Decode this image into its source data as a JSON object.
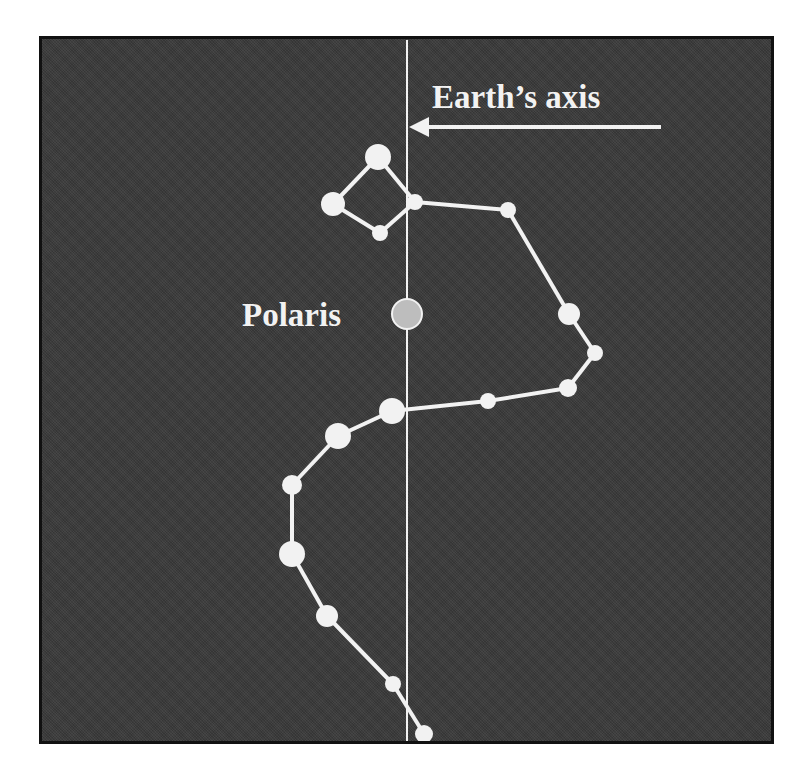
{
  "labels": {
    "axis": "Earth’s axis",
    "polaris": "Polaris"
  },
  "colors": {
    "background": "#3b3b3b",
    "border": "#111111",
    "stars": "#f2f2f2",
    "polaris_fill": "#bdbdbd"
  },
  "axis_line": {
    "x": 407,
    "y1": 40,
    "y2": 742
  },
  "arrow": {
    "x1": 661,
    "x2": 409,
    "y": 127
  },
  "polaris": {
    "x": 407,
    "y": 314,
    "r": 15
  },
  "stars": [
    {
      "x": 378,
      "y": 157,
      "r": 13
    },
    {
      "x": 333,
      "y": 204,
      "r": 12
    },
    {
      "x": 380,
      "y": 233,
      "r": 8
    },
    {
      "x": 415,
      "y": 202,
      "r": 8
    },
    {
      "x": 508,
      "y": 210,
      "r": 8
    },
    {
      "x": 569,
      "y": 314,
      "r": 11
    },
    {
      "x": 595,
      "y": 353,
      "r": 8
    },
    {
      "x": 568,
      "y": 388,
      "r": 9
    },
    {
      "x": 488,
      "y": 401,
      "r": 8
    },
    {
      "x": 392,
      "y": 411,
      "r": 13
    },
    {
      "x": 338,
      "y": 436,
      "r": 13
    },
    {
      "x": 292,
      "y": 485,
      "r": 10
    },
    {
      "x": 292,
      "y": 554,
      "r": 13
    },
    {
      "x": 327,
      "y": 616,
      "r": 11
    },
    {
      "x": 393,
      "y": 684,
      "r": 8
    },
    {
      "x": 424,
      "y": 734,
      "r": 9
    }
  ],
  "lines": [
    [
      0,
      1
    ],
    [
      1,
      2
    ],
    [
      2,
      3
    ],
    [
      3,
      0
    ],
    [
      3,
      4
    ],
    [
      4,
      5
    ],
    [
      5,
      6
    ],
    [
      6,
      7
    ],
    [
      7,
      8
    ],
    [
      8,
      9
    ],
    [
      9,
      10
    ],
    [
      10,
      11
    ],
    [
      11,
      12
    ],
    [
      12,
      13
    ],
    [
      13,
      14
    ],
    [
      14,
      15
    ]
  ]
}
